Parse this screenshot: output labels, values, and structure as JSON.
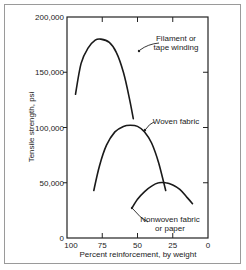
{
  "chart_data": {
    "type": "line",
    "title": "",
    "xlabel": "Percent reinforcement, by weight",
    "ylabel": "Tensile strength, psi",
    "xlim": [
      100,
      0
    ],
    "ylim": [
      0,
      200000
    ],
    "x_reversed": true,
    "xticks": [
      100,
      75,
      50,
      25,
      0
    ],
    "xtick_labels": [
      "100",
      "75",
      "50",
      "25",
      "0"
    ],
    "yticks": [
      0,
      50000,
      100000,
      150000,
      200000
    ],
    "ytick_labels": [
      "0",
      "50,000",
      "100,000",
      "150,000",
      "200,000"
    ],
    "grid": false,
    "legend": "none (inline annotations)",
    "series": [
      {
        "name": "Filament or tape winding",
        "label_lines": [
          "Filament or",
          "tape winding"
        ],
        "x": [
          94,
          90,
          85,
          80,
          76,
          70,
          65,
          60,
          56,
          53
        ],
        "y": [
          130000,
          158000,
          172000,
          179000,
          180000,
          177000,
          168000,
          150000,
          128000,
          108000
        ]
      },
      {
        "name": "Woven fabric",
        "label_lines": [
          "Woven fabric"
        ],
        "x": [
          81,
          77,
          72,
          66,
          60,
          55,
          50,
          45,
          40,
          35,
          30
        ],
        "y": [
          43000,
          65000,
          84000,
          96000,
          101000,
          102000,
          101000,
          96000,
          86000,
          68000,
          43000
        ]
      },
      {
        "name": "Nonwoven fabric or paper",
        "label_lines": [
          "Nonwoven fabric",
          "or paper"
        ],
        "x": [
          54,
          50,
          45,
          40,
          35,
          30,
          25,
          20,
          15,
          11
        ],
        "y": [
          27000,
          35000,
          42000,
          47000,
          50000,
          50000,
          48000,
          44000,
          37000,
          31000
        ]
      }
    ]
  }
}
